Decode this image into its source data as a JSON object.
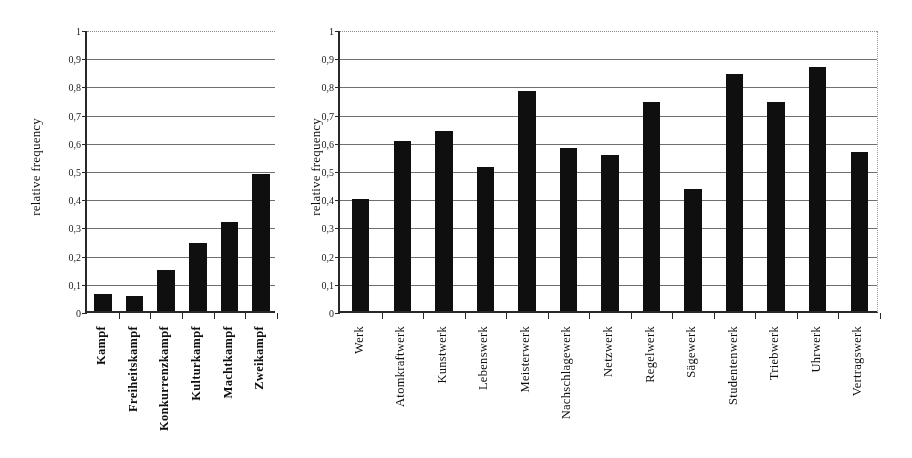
{
  "figure": {
    "panels": [
      "left",
      "right"
    ]
  },
  "chart_data": [
    {
      "id": "kampf-chart",
      "type": "bar",
      "title": "",
      "xlabel": "",
      "ylabel": "relative frequency",
      "ylim": [
        0,
        1
      ],
      "ytick_values": [
        0,
        0.1,
        0.2,
        0.3,
        0.4,
        0.5,
        0.6,
        0.7,
        0.8,
        0.9,
        1
      ],
      "ytick_labels": [
        "0",
        "0,1",
        "0,2",
        "0,3",
        "0,4",
        "0,5",
        "0,6",
        "0,7",
        "0,8",
        "0,9",
        "1"
      ],
      "grid": true,
      "legend": "none",
      "bar_color": "#111111",
      "categories": [
        "Kampf",
        "Freiheitskampf",
        "Konkurrenzkampf",
        "Kulturkampf",
        "Machtkampf",
        "Zweikampf"
      ],
      "values": [
        0.06,
        0.055,
        0.145,
        0.24,
        0.317,
        0.487
      ]
    },
    {
      "id": "werk-chart",
      "type": "bar",
      "title": "",
      "xlabel": "",
      "ylabel": "relative frequency",
      "ylim": [
        0,
        1
      ],
      "ytick_values": [
        0,
        0.1,
        0.2,
        0.3,
        0.4,
        0.5,
        0.6,
        0.7,
        0.8,
        0.9,
        1
      ],
      "ytick_labels": [
        "0",
        "0,1",
        "0,2",
        "0,3",
        "0,4",
        "0,5",
        "0,6",
        "0,7",
        "0,8",
        "0,9",
        "1"
      ],
      "grid": true,
      "legend": "none",
      "bar_color": "#111111",
      "categories": [
        "Werk",
        "Atomkraftwerk",
        "Kunstwerk",
        "Lebenswerk",
        "Meisterwerk",
        "Nachschlagewerk",
        "Netzwerk",
        "Regelwerk",
        "Sägewerk",
        "Studentenwerk",
        "Triebwerk",
        "Uhrwerk",
        "Vertragswerk"
      ],
      "values": [
        0.398,
        0.603,
        0.637,
        0.511,
        0.781,
        0.578,
        0.555,
        0.742,
        0.432,
        0.839,
        0.742,
        0.864,
        0.565
      ]
    }
  ]
}
